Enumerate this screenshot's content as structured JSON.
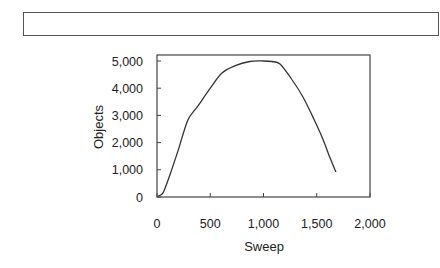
{
  "caption_box": {
    "text": ""
  },
  "chart_data": {
    "type": "line",
    "title": "",
    "xlabel": "Sweep",
    "ylabel": "Objects",
    "xlim": [
      0,
      2000
    ],
    "ylim": [
      0,
      5000
    ],
    "x_ticks": [
      0,
      500,
      1000,
      1500,
      2000
    ],
    "x_tick_labels": [
      "0",
      "500",
      "1,000",
      "1,500",
      "2,000"
    ],
    "y_ticks": [
      0,
      1000,
      2000,
      3000,
      4000,
      5000
    ],
    "y_tick_labels": [
      "0",
      "1,000",
      "2,000",
      "3,000",
      "4,000",
      "5,000"
    ],
    "grid": false,
    "legend": null,
    "series": [
      {
        "name": "Objects",
        "x": [
          10,
          56,
          120,
          200,
          290,
          385,
          500,
          610,
          730,
          870,
          1000,
          1080,
          1155,
          1250,
          1360,
          1455,
          1550,
          1625,
          1680
        ],
        "values": [
          35,
          150,
          800,
          1730,
          2830,
          3350,
          4000,
          4560,
          4820,
          4980,
          5000,
          4980,
          4890,
          4410,
          3750,
          3010,
          2200,
          1430,
          920
        ]
      }
    ]
  },
  "colors": {
    "line": "#333333",
    "axis": "#444444",
    "background": "#ffffff"
  }
}
